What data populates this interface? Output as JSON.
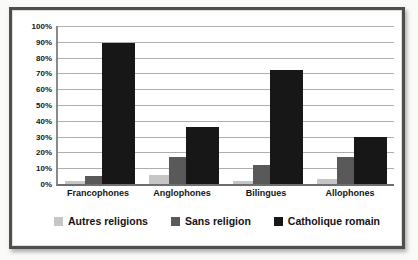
{
  "chart_data": {
    "type": "bar",
    "title": "",
    "xlabel": "",
    "ylabel": "",
    "categories": [
      "Francophones",
      "Anglophones",
      "Bilingues",
      "Allophones"
    ],
    "series": [
      {
        "name": "Autres religions",
        "color": "#c6c6c6",
        "values": [
          2,
          6,
          2,
          3
        ]
      },
      {
        "name": "Sans religion",
        "color": "#595959",
        "values": [
          5,
          17,
          12,
          17
        ]
      },
      {
        "name": "Catholique romain",
        "color": "#171717",
        "values": [
          89,
          36,
          72,
          30
        ]
      }
    ],
    "ylim": [
      0,
      100
    ],
    "yticks": [
      "100%",
      "90%",
      "80%",
      "70%",
      "60%",
      "50%",
      "40%",
      "30%",
      "20%",
      "10%",
      "0%"
    ],
    "grid": "horizontal",
    "legend_position": "bottom",
    "colors": {
      "frame_border": "#4e4e4e",
      "gridline": "#aeaeae",
      "axis": "#6f6f6f",
      "background": "#ffffff",
      "text": "#141414"
    }
  }
}
